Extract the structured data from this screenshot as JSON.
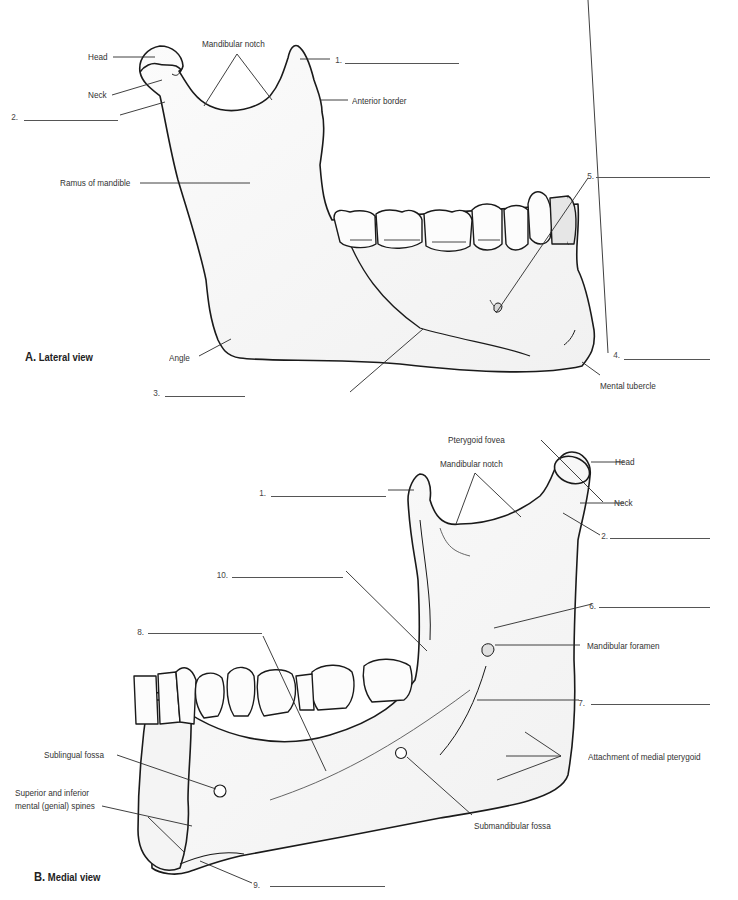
{
  "figure": {
    "views": [
      {
        "id": "A",
        "letter": "A.",
        "title": "Lateral view",
        "labels": {
          "head": "Head",
          "neck": "Neck",
          "mandibular_notch": "Mandibular notch",
          "anterior_border": "Anterior border",
          "ramus": "Ramus of mandible",
          "angle": "Angle",
          "mental_tubercle": "Mental tubercle"
        },
        "blanks": [
          {
            "number": "1.",
            "answer": ""
          },
          {
            "number": "2.",
            "answer": ""
          },
          {
            "number": "3.",
            "answer": ""
          },
          {
            "number": "4.",
            "answer": ""
          },
          {
            "number": "5.",
            "answer": ""
          }
        ]
      },
      {
        "id": "B",
        "letter": "B.",
        "title": "Medial view",
        "labels": {
          "pterygoid_fovea": "Pterygoid fovea",
          "mandibular_notch": "Mandibular notch",
          "head": "Head",
          "neck": "Neck",
          "mandibular_foramen": "Mandibular foramen",
          "attachment_medial_pterygoid": "Attachment of medial pterygoid",
          "submandibular_fossa": "Submandibular fossa",
          "sublingual_fossa": "Sublingual fossa",
          "mental_spines_line1": "Superior and inferior",
          "mental_spines_line2": "mental (genial) spines"
        },
        "blanks": [
          {
            "number": "1.",
            "answer": ""
          },
          {
            "number": "2.",
            "answer": ""
          },
          {
            "number": "6.",
            "answer": ""
          },
          {
            "number": "7.",
            "answer": ""
          },
          {
            "number": "8.",
            "answer": ""
          },
          {
            "number": "9.",
            "answer": ""
          },
          {
            "number": "10.",
            "answer": ""
          }
        ]
      }
    ]
  }
}
